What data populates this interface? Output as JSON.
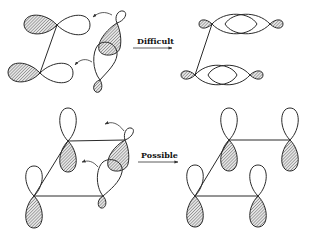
{
  "figure": {
    "top_row": {
      "label": "Difficult",
      "left_panel": "two horizontal p-orbitals with tilted p-orbital pair approaching",
      "right_panel": "coplanar end-on overlapping orbitals"
    },
    "bottom_row": {
      "label": "Possible",
      "left_panel": "two vertical p-orbitals with tilted p-orbital pair approaching",
      "right_panel": "four parallel vertical p-orbitals forming rectangle"
    }
  },
  "labels": {
    "difficult": "Difficult",
    "possible": "Possible"
  },
  "colors": {
    "stroke": "#2a2a2a",
    "background": "#ffffff"
  }
}
